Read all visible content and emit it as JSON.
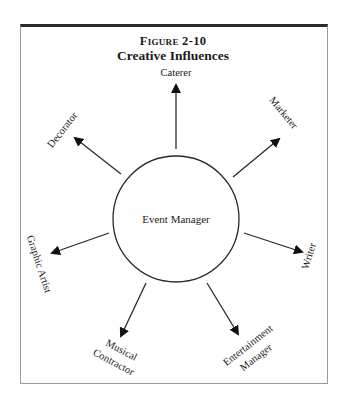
{
  "figure": {
    "number": "Figure 2-10",
    "title": "Creative Influences"
  },
  "center": {
    "label": "Event Manager"
  },
  "nodes": [
    {
      "label": "Caterer"
    },
    {
      "label": "Marketer"
    },
    {
      "label": "Writer"
    },
    {
      "label": "Entertainment",
      "label2": "Manager"
    },
    {
      "label": "Musical",
      "label2": "Contractor"
    },
    {
      "label": "Graphic Artist"
    },
    {
      "label": "Decorator"
    }
  ],
  "colors": {
    "line": "#2a2a2a",
    "border": "#9a9a9a"
  }
}
